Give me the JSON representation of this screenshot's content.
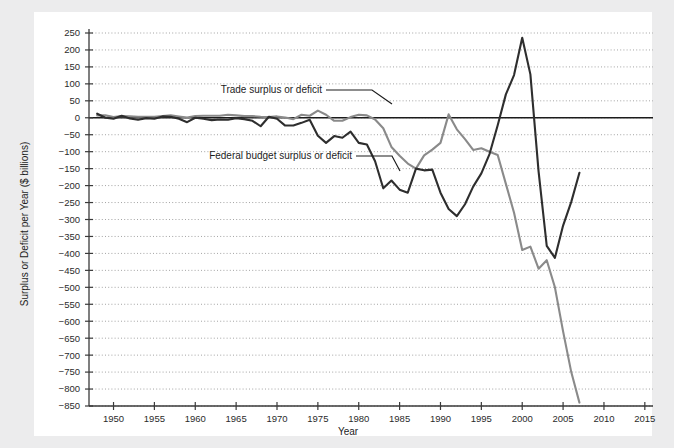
{
  "page": {
    "background_color": "#ececed",
    "panel_color": "#ffffff"
  },
  "chart_data": {
    "type": "line",
    "title": "",
    "xlabel": "Year",
    "ylabel": "Surplus or Deficit per Year ($ billions)",
    "xlim": [
      1947,
      2016
    ],
    "ylim": [
      -850,
      250
    ],
    "xticks": [
      1950,
      1955,
      1960,
      1965,
      1970,
      1975,
      1980,
      1985,
      1990,
      1995,
      2000,
      2005,
      2010,
      2015
    ],
    "xticklabels": [
      "1950",
      "1955",
      "1960",
      "1965",
      "1970",
      "1975",
      "1980",
      "1985",
      "1990",
      "1995",
      "2000",
      "2005",
      "2010",
      "2015"
    ],
    "yticks": [
      250,
      200,
      150,
      100,
      50,
      0,
      -50,
      -100,
      -150,
      -200,
      -250,
      -300,
      -350,
      -400,
      -450,
      -500,
      -550,
      -600,
      -650,
      -700,
      -750,
      -800,
      -850
    ],
    "yticklabels": [
      "250",
      "200",
      "150",
      "100",
      "50",
      "0",
      "− 50",
      "− 100",
      "− 150",
      "− 200",
      "− 250",
      "− 300",
      "− 350",
      "− 400",
      "− 450",
      "− 500",
      "− 550",
      "− 600",
      "− 650",
      "− 700",
      "− 750",
      "− 800",
      "− 850"
    ],
    "grid": "horizontal-dotted",
    "zero_line": true,
    "legend_position": "inline-annotations",
    "series": [
      {
        "name": "Trade surplus or deficit",
        "color": "#8a8a8a",
        "x": [
          1948,
          1949,
          1950,
          1951,
          1952,
          1953,
          1954,
          1955,
          1956,
          1957,
          1958,
          1959,
          1960,
          1961,
          1962,
          1963,
          1964,
          1965,
          1966,
          1967,
          1968,
          1969,
          1970,
          1971,
          1972,
          1973,
          1974,
          1975,
          1976,
          1977,
          1978,
          1979,
          1980,
          1981,
          1982,
          1983,
          1984,
          1985,
          1986,
          1987,
          1988,
          1989,
          1990,
          1991,
          1992,
          1993,
          1994,
          1995,
          1996,
          1997,
          1998,
          1999,
          2000,
          2001,
          2002,
          2003,
          2004,
          2005,
          2006,
          2007
        ],
        "values": [
          7,
          7,
          2,
          5,
          4,
          3,
          3,
          3,
          5,
          7,
          4,
          1,
          5,
          6,
          6,
          6,
          9,
          7,
          5,
          5,
          3,
          2,
          4,
          1,
          -4,
          9,
          6,
          21,
          9,
          -9,
          -9,
          2,
          9,
          7,
          -5,
          -31,
          -86,
          -112,
          -135,
          -150,
          -111,
          -94,
          -74,
          10,
          -34,
          -63,
          -95,
          -90,
          -100,
          -110,
          -195,
          -280,
          -390,
          -380,
          -445,
          -420,
          -500,
          -630,
          -750,
          -840
        ]
      },
      {
        "name": "Federal budget surplus or deficit",
        "color": "#2e2e2e",
        "x": [
          1948,
          1949,
          1950,
          1951,
          1952,
          1953,
          1954,
          1955,
          1956,
          1957,
          1958,
          1959,
          1960,
          1961,
          1962,
          1963,
          1964,
          1965,
          1966,
          1967,
          1968,
          1969,
          1970,
          1971,
          1972,
          1973,
          1974,
          1975,
          1976,
          1977,
          1978,
          1979,
          1980,
          1981,
          1982,
          1983,
          1984,
          1985,
          1986,
          1987,
          1988,
          1989,
          1990,
          1991,
          1992,
          1993,
          1994,
          1995,
          1996,
          1997,
          1998,
          1999,
          2000,
          2001,
          2002,
          2003,
          2004,
          2005,
          2006,
          2007
        ],
        "values": [
          12,
          0,
          -3,
          6,
          -2,
          -6,
          -1,
          -3,
          4,
          3,
          -3,
          -13,
          0,
          -3,
          -7,
          -5,
          -6,
          -1,
          -4,
          -9,
          -25,
          3,
          -3,
          -23,
          -23,
          -15,
          -6,
          -53,
          -74,
          -54,
          -59,
          -41,
          -74,
          -79,
          -128,
          -208,
          -185,
          -212,
          -221,
          -150,
          -155,
          -153,
          -221,
          -269,
          -290,
          -255,
          -203,
          -164,
          -107,
          -22,
          69,
          126,
          236,
          128,
          -158,
          -378,
          -413,
          -318,
          -248,
          -162
        ]
      }
    ],
    "annotations": [
      {
        "text": "Trade surplus or deficit",
        "target_series": "Trade surplus or deficit"
      },
      {
        "text": "Federal budget surplus or deficit",
        "target_series": "Federal budget surplus or deficit"
      }
    ]
  }
}
